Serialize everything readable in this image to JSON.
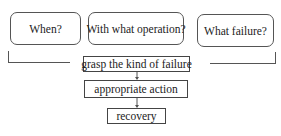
{
  "diagram": {
    "questions": [
      {
        "id": "when",
        "label": "When?"
      },
      {
        "id": "operation",
        "label": "With what operation?"
      },
      {
        "id": "failure",
        "label": "What failure?"
      }
    ],
    "steps": [
      {
        "id": "grasp",
        "label": "grasp the kind of failure"
      },
      {
        "id": "action",
        "label": "appropriate action"
      },
      {
        "id": "recovery",
        "label": "recovery"
      }
    ],
    "edges": [
      {
        "from": "grasp",
        "to": "action"
      },
      {
        "from": "action",
        "to": "recovery"
      }
    ],
    "colors": {
      "line": "#555555",
      "background": "#ffffff",
      "text": "#222222"
    }
  }
}
